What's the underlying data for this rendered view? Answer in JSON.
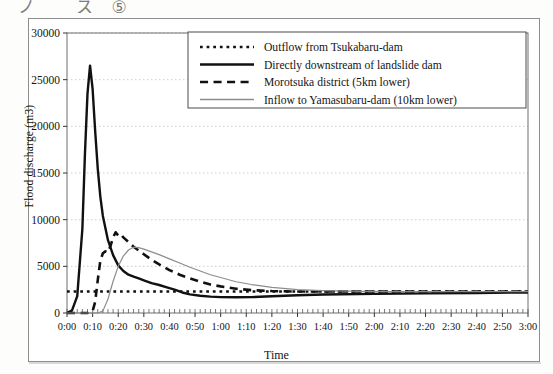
{
  "page": {
    "caption_fragment": "ノ ス⑤"
  },
  "chart_data": {
    "type": "line",
    "title": "",
    "xlabel": "Time",
    "ylabel": "Flood discharge (m3)",
    "ylim": [
      0,
      30000
    ],
    "ytick_step": 5000,
    "yticks": [
      0,
      5000,
      10000,
      15000,
      20000,
      25000,
      30000
    ],
    "ytick_labels": [
      "0",
      "5000",
      "10000",
      "15000",
      "20000",
      "25000",
      "30000"
    ],
    "xlim": [
      0,
      180
    ],
    "xtick_step": 10,
    "xticks": [
      0,
      10,
      20,
      30,
      40,
      50,
      60,
      70,
      80,
      90,
      100,
      110,
      120,
      130,
      140,
      150,
      160,
      170,
      180
    ],
    "xtick_labels": [
      "0:00",
      "0:10",
      "0:20",
      "0:30",
      "0:40",
      "0:50",
      "1:00",
      "1:10",
      "1:20",
      "1:30",
      "1:40",
      "1:50",
      "2:00",
      "2:10",
      "2:20",
      "2:30",
      "2:40",
      "2:50",
      "3:00"
    ],
    "x_unit": "minutes",
    "grid": {
      "horizontal": true,
      "vertical": false,
      "style": "dotted",
      "color": "#c9c9c9"
    },
    "legend": {
      "position": "top-right",
      "border": true
    },
    "series": [
      {
        "name": "Outflow from Tsukabaru-dam",
        "style": "dotted",
        "color": "#111111",
        "width": 2.6,
        "x": [
          0,
          5,
          10,
          20,
          30,
          45,
          60,
          80,
          100,
          120,
          140,
          160,
          180
        ],
        "values": [
          2300,
          2300,
          2300,
          2300,
          2300,
          2300,
          2300,
          2300,
          2300,
          2300,
          2300,
          2300,
          2300
        ]
      },
      {
        "name": "Directly downstream of landslide dam",
        "style": "solid",
        "color": "#111111",
        "width": 2.4,
        "x": [
          0,
          2,
          4,
          6,
          7,
          8,
          9,
          10,
          11,
          12,
          13,
          14,
          16,
          18,
          20,
          22,
          24,
          26,
          28,
          30,
          33,
          36,
          39,
          42,
          45,
          48,
          52,
          56,
          60,
          66,
          72,
          80,
          90,
          100,
          120,
          140,
          160,
          180
        ],
        "values": [
          0,
          300,
          1800,
          9000,
          17000,
          23500,
          26500,
          24000,
          19500,
          15500,
          12500,
          10400,
          7800,
          6200,
          5100,
          4500,
          4100,
          3900,
          3700,
          3500,
          3200,
          3000,
          2750,
          2500,
          2200,
          2000,
          1850,
          1750,
          1700,
          1680,
          1700,
          1800,
          1900,
          1980,
          2050,
          2100,
          2150,
          2200
        ]
      },
      {
        "name": "Morotsuka district (5km lower)",
        "style": "dashed",
        "color": "#111111",
        "width": 2.6,
        "x": [
          0,
          8,
          10,
          11,
          12,
          13,
          14,
          15,
          16,
          17,
          18,
          19,
          20,
          21,
          22,
          24,
          26,
          28,
          30,
          33,
          36,
          40,
          44,
          48,
          52,
          56,
          60,
          66,
          72,
          80,
          90,
          100,
          115,
          130,
          150,
          180
        ],
        "values": [
          0,
          0,
          200,
          1200,
          3500,
          5600,
          6400,
          6600,
          6500,
          7200,
          8100,
          8650,
          8300,
          8450,
          8100,
          7600,
          7100,
          6700,
          6300,
          5700,
          5200,
          4600,
          4100,
          3700,
          3350,
          3050,
          2850,
          2600,
          2450,
          2350,
          2300,
          2300,
          2300,
          2300,
          2300,
          2300
        ]
      },
      {
        "name": "Inflow to Yamasubaru-dam (10km lower)",
        "style": "solid",
        "color": "#8c8c8c",
        "width": 1.2,
        "x": [
          0,
          12,
          14,
          16,
          18,
          20,
          22,
          24,
          26,
          28,
          30,
          33,
          36,
          40,
          44,
          48,
          52,
          56,
          60,
          66,
          72,
          80,
          90,
          100,
          115,
          130,
          150,
          180
        ],
        "values": [
          0,
          0,
          200,
          1500,
          3400,
          5000,
          6100,
          6750,
          7050,
          7000,
          6850,
          6550,
          6250,
          5800,
          5350,
          4900,
          4500,
          4100,
          3800,
          3350,
          3050,
          2750,
          2500,
          2400,
          2320,
          2300,
          2300,
          2300
        ]
      }
    ]
  }
}
